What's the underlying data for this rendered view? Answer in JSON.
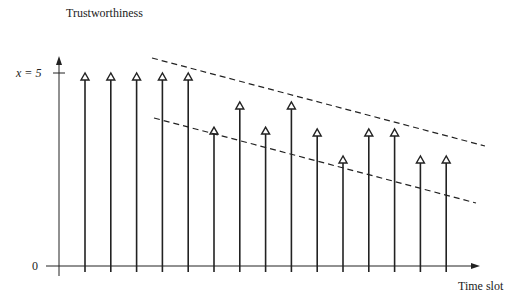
{
  "labels": {
    "y_axis": "Trustworthiness",
    "x_axis": "Time slot",
    "y_tick_top": "x = 5",
    "y_tick_zero": "0"
  },
  "colors": {
    "ink": "#222222",
    "background": "#ffffff"
  },
  "chart_data": {
    "type": "stem",
    "title": "",
    "xlabel": "Time slot",
    "ylabel": "Trustworthiness",
    "y_ticks": [
      {
        "label": "0",
        "value": 0
      },
      {
        "label": "x = 5",
        "value": 5
      }
    ],
    "x": [
      1,
      2,
      3,
      4,
      5,
      6,
      7,
      8,
      9,
      10,
      11,
      12,
      13,
      14,
      15
    ],
    "values": [
      5,
      5,
      5,
      5,
      5,
      3.6,
      4.25,
      3.6,
      4.25,
      3.55,
      2.85,
      3.55,
      3.55,
      2.85,
      2.85
    ],
    "trend_lines": [
      {
        "name": "upper bound (dashed)",
        "from": [
          4,
          5.5
        ],
        "to": [
          16,
          3.1
        ]
      },
      {
        "name": "lower bound (dashed)",
        "from": [
          4,
          4.0
        ],
        "to": [
          16,
          1.7
        ]
      }
    ],
    "ylim": [
      0,
      5.5
    ]
  }
}
